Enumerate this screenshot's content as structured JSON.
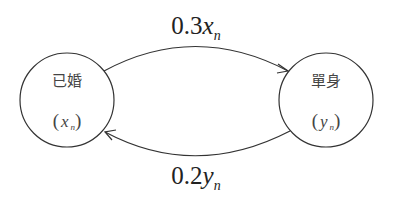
{
  "diagram": {
    "type": "state-transition",
    "colors": {
      "stroke": "#333333",
      "text": "#222222",
      "background": "#ffffff"
    },
    "nodes": [
      {
        "id": "married",
        "name": "已婚",
        "var": "x",
        "sub": "n",
        "open_paren": "(",
        "close_paren": ")"
      },
      {
        "id": "single",
        "name": "單身",
        "var": "y",
        "sub": "n",
        "open_paren": "(",
        "close_paren": ")"
      }
    ],
    "edges": [
      {
        "from": "married",
        "to": "single",
        "coef": "0.3",
        "var": "x",
        "sub": "n"
      },
      {
        "from": "single",
        "to": "married",
        "coef": "0.2",
        "var": "y",
        "sub": "n"
      }
    ]
  }
}
